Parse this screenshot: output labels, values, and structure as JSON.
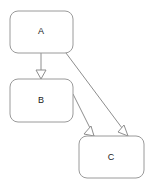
{
  "diagram": {
    "type": "uml-generalization-diagram",
    "canvas": {
      "width": 149,
      "height": 185,
      "background": "#ffffff"
    },
    "style": {
      "node_fill": "#ffffff",
      "node_stroke": "#9a9a9a",
      "edge_stroke": "#8e8e8e",
      "label_color": "#1a1a1a",
      "arrowhead_fill": "#ffffff",
      "corner_radius": 8
    },
    "nodes": [
      {
        "id": "A",
        "label": "A",
        "x": 10,
        "y": 11,
        "width": 63,
        "height": 42,
        "label_x": 41,
        "label_y": 32
      },
      {
        "id": "B",
        "label": "B",
        "x": 10,
        "y": 79,
        "width": 63,
        "height": 43,
        "label_x": 41,
        "label_y": 101
      },
      {
        "id": "C",
        "label": "C",
        "x": 79,
        "y": 136,
        "width": 65,
        "height": 42,
        "label_x": 111,
        "label_y": 158
      }
    ],
    "edges": [
      {
        "id": "edge-a-b",
        "from": "A",
        "to": "B",
        "kind": "generalization",
        "path": "M 41 53 L 41 79",
        "arrow_tip_x": 41,
        "arrow_tip_y": 79,
        "arrow_points": "41,79 36,70 46,70"
      },
      {
        "id": "edge-a-c",
        "from": "A",
        "to": "C",
        "kind": "generalization",
        "path": "M 63 49 L 128 136",
        "arrow_tip_x": 128,
        "arrow_tip_y": 136,
        "arrow_points": "128,136 118,132 124,125"
      },
      {
        "id": "edge-b-c",
        "from": "B",
        "to": "C",
        "kind": "generalization",
        "path": "M 73 94 L 94 136",
        "arrow_tip_x": 94,
        "arrow_tip_y": 136,
        "arrow_points": "94,136 84,134 91,126"
      }
    ]
  }
}
